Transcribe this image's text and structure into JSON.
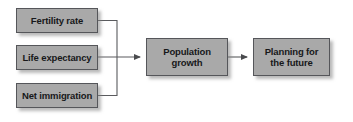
{
  "diagram": {
    "background_color": "#ffffff",
    "box_fill_color": "#a9a9a9",
    "box_border_color": "#55565a",
    "line_color": "#5a5b5e",
    "text_color": "#17181a",
    "nodes": [
      {
        "id": "fertility-rate",
        "label": "Fertility rate"
      },
      {
        "id": "life-expectancy",
        "label": "Life expectancy"
      },
      {
        "id": "net-immigration",
        "label": "Net immigration"
      },
      {
        "id": "population-growth",
        "label": "Population\ngrowth"
      },
      {
        "id": "planning-future",
        "label": "Planning for\nthe future"
      }
    ],
    "connectors": [
      {
        "id": "fertility-to-growth",
        "from": "fertility-rate",
        "to": "population-growth",
        "style": "elbow",
        "arrowhead": true
      },
      {
        "id": "life-expectancy-to-growth",
        "from": "life-expectancy",
        "to": "population-growth",
        "style": "straight",
        "arrowhead": true
      },
      {
        "id": "immigration-to-growth",
        "from": "net-immigration",
        "to": "population-growth",
        "style": "elbow",
        "arrowhead": true
      },
      {
        "id": "growth-to-planning",
        "from": "population-growth",
        "to": "planning-future",
        "style": "straight",
        "arrowhead": true
      }
    ]
  }
}
